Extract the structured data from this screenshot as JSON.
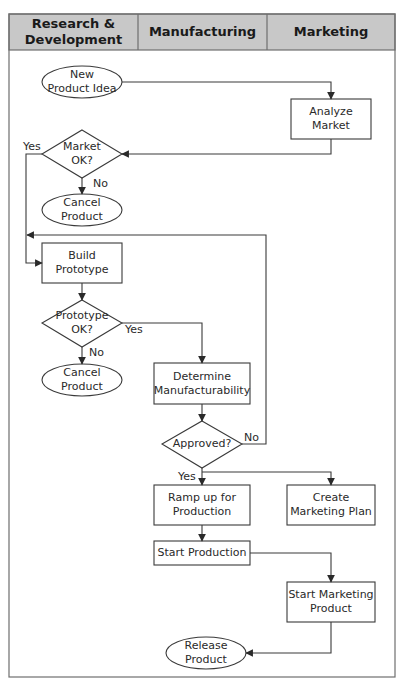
{
  "lanes": [
    {
      "label": "Research &\nDevelopment"
    },
    {
      "label": "Manufacturing"
    },
    {
      "label": "Marketing"
    }
  ],
  "nodes": {
    "new_product_idea": {
      "label": "New\nProduct Idea",
      "shape": "ellipse",
      "lane": "Research & Development"
    },
    "analyze_market": {
      "label": "Analyze\nMarket",
      "shape": "rectangle",
      "lane": "Marketing"
    },
    "market_ok": {
      "label": "Market\nOK?",
      "shape": "diamond",
      "lane": "Research & Development"
    },
    "cancel_product_1": {
      "label": "Cancel\nProduct",
      "shape": "ellipse",
      "lane": "Research & Development"
    },
    "build_prototype": {
      "label": "Build\nPrototype",
      "shape": "rectangle",
      "lane": "Research & Development"
    },
    "prototype_ok": {
      "label": "Prototype\nOK?",
      "shape": "diamond",
      "lane": "Research & Development"
    },
    "cancel_product_2": {
      "label": "Cancel\nProduct",
      "shape": "ellipse",
      "lane": "Research & Development"
    },
    "determine_manufacturability": {
      "label": "Determine\nManufacturability",
      "shape": "rectangle",
      "lane": "Manufacturing"
    },
    "approved": {
      "label": "Approved?",
      "shape": "diamond",
      "lane": "Manufacturing"
    },
    "ramp_up": {
      "label": "Ramp up for\nProduction",
      "shape": "rectangle",
      "lane": "Manufacturing"
    },
    "create_marketing_plan": {
      "label": "Create\nMarketing Plan",
      "shape": "rectangle",
      "lane": "Marketing"
    },
    "start_production": {
      "label": "Start Production",
      "shape": "rectangle",
      "lane": "Manufacturing"
    },
    "start_marketing_product": {
      "label": "Start Marketing\nProduct",
      "shape": "rectangle",
      "lane": "Marketing"
    },
    "release_product": {
      "label": "Release\nProduct",
      "shape": "ellipse",
      "lane": "Manufacturing"
    }
  },
  "edge_labels": {
    "market_yes": "Yes",
    "market_no": "No",
    "prototype_yes": "Yes",
    "prototype_no": "No",
    "approved_yes": "Yes",
    "approved_no": "No"
  },
  "edges": [
    {
      "from": "New Product Idea",
      "to": "Analyze Market"
    },
    {
      "from": "Analyze Market",
      "to": "Market OK?"
    },
    {
      "from": "Market OK?",
      "to": "Build Prototype",
      "label": "Yes"
    },
    {
      "from": "Market OK?",
      "to": "Cancel Product",
      "label": "No"
    },
    {
      "from": "Build Prototype",
      "to": "Prototype OK?"
    },
    {
      "from": "Prototype OK?",
      "to": "Determine Manufacturability",
      "label": "Yes"
    },
    {
      "from": "Prototype OK?",
      "to": "Cancel Product",
      "label": "No"
    },
    {
      "from": "Determine Manufacturability",
      "to": "Approved?"
    },
    {
      "from": "Approved?",
      "to": "Build Prototype",
      "label": "No"
    },
    {
      "from": "Approved?",
      "to": "Ramp up for Production",
      "label": "Yes"
    },
    {
      "from": "Approved?",
      "to": "Create Marketing Plan",
      "label": "Yes"
    },
    {
      "from": "Ramp up for Production",
      "to": "Start Production"
    },
    {
      "from": "Start Production",
      "to": "Start Marketing Product"
    },
    {
      "from": "Start Marketing Product",
      "to": "Release Product"
    }
  ],
  "colors": {
    "header_fill": "#c8c8c8",
    "line": "#3a3a3a",
    "frame": "#6e6e6e"
  }
}
